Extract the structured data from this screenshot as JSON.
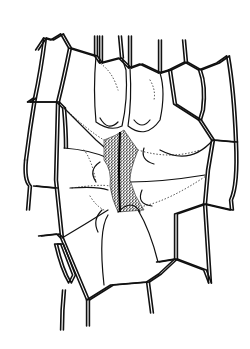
{
  "figure": {
    "title": "",
    "style": "black ink line drawing on white",
    "colors": {
      "ink": "#111111",
      "background": "#ffffff"
    },
    "cell_walls_outer": [
      "M37 50 L45 38 L52 40 L62 34",
      "M45 38 Q41 70 35 98 Q30 128 26 160",
      "M62 34 L70 48 L96 56 L101 63 L120 58 L130 68 L141 64 L160 73 L170 70",
      "M70 48 Q64 78 58 102",
      "M29 102 L58 102 L64 108",
      "M35 98 L29 102",
      "M96 36 L96 56",
      "M101 36 L101 63",
      "M120 36 L122 58",
      "M130 36 L130 68",
      "M160 40 L160 73",
      "M170 70 L186 62 L200 70 L218 63 L228 56",
      "M186 62 L184 40",
      "M200 70 Q206 86 203 110 L200 120",
      "M170 70 L175 104 L200 120",
      "M228 56 Q234 90 236 142",
      "M200 120 L213 140 L236 142",
      "M236 142 Q238 185 231 200 L232 210",
      "M213 140 L208 170 L205 204",
      "M205 204 L231 210",
      "M64 108 Q66 130 66 148",
      "M26 160 Q24 180 30 186 L28 210",
      "M58 102 L56 180 L62 238 L88 300",
      "M35 186 L56 188",
      "M40 236 L58 234 L62 238",
      "M56 244 Q62 270 70 283 L74 275 L62 244 Z",
      "M64 290 Q62 310 62 330",
      "M88 300 L88 326",
      "M88 300 L112 285 L148 282 L160 274 L176 259 L205 270 L210 283",
      "M148 282 L152 313",
      "M176 259 L176 214 L205 204",
      "M176 259 L158 262",
      "M205 204 L210 283"
    ],
    "subsidiary_cells": [
      "M96 56 Q93 90 96 122 Q110 132 122 126 Q128 100 126 70 L122 58",
      "M130 68 Q132 100 128 126 Q146 140 160 120 Q166 92 160 73",
      "M64 108 Q86 130 96 140 Q108 150 118 160",
      "M64 148 Q90 150 108 158",
      "M70 188 Q98 186 108 190",
      "M62 238 Q84 225 108 210",
      "M160 150 Q190 166 213 140",
      "M130 182 Q162 182 205 175",
      "M108 215 Q98 230 104 285",
      "M138 210 Q150 230 158 262"
    ],
    "guard_cell_arcs": [
      "M100 118 Q108 132 118 122",
      "M134 120 Q142 130 150 120",
      "M144 148 Q140 160 154 164",
      "M100 162 Q88 170 96 182",
      "M142 190 Q136 204 152 206",
      "M102 210 Q92 220 98 232",
      "M118 212 Q132 198 140 212"
    ],
    "pore_region": {
      "outline": "M104 140 Q116 136 124 130 Q132 142 138 150 Q130 170 130 180 Q134 196 144 210 L118 212 Q112 200 110 186 Q112 170 104 160 Z",
      "fill": "#444444",
      "slit": "M120 132 Q118 170 120 212"
    },
    "dotted_lines": [
      "M64 108 Q90 132 104 140",
      "M138 150 Q170 160 200 150",
      "M84 150 Q92 160 96 182",
      "M90 196 Q96 206 104 210",
      "M72 188 Q100 184 110 186",
      "M144 206 Q170 200 206 176",
      "M98 62 Q112 70 118 90",
      "M150 80 Q156 90 154 100"
    ]
  }
}
